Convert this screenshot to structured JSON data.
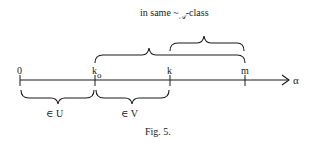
{
  "annotation": {
    "prefix": "in same ",
    "relation_symbol": "~",
    "subscript": "𝒜",
    "suffix": "-class"
  },
  "axis": {
    "label": "α",
    "ticks": [
      {
        "label": "0",
        "sub": ""
      },
      {
        "label": "k",
        "sub": "o"
      },
      {
        "label": "k",
        "sub": ""
      },
      {
        "label": "m",
        "sub": ""
      }
    ]
  },
  "lower_braces": [
    {
      "from": "0",
      "to": "k_o",
      "label": "∈ U"
    },
    {
      "from": "k_o",
      "to": "k",
      "label": "∈ V"
    }
  ],
  "upper_braces": [
    {
      "from": "k_o",
      "to": "m"
    },
    {
      "from": "k",
      "to": "m"
    }
  ],
  "caption": "Fig. 5.",
  "colors": {
    "ink": "#1a1a1a",
    "background": "#ffffff"
  }
}
